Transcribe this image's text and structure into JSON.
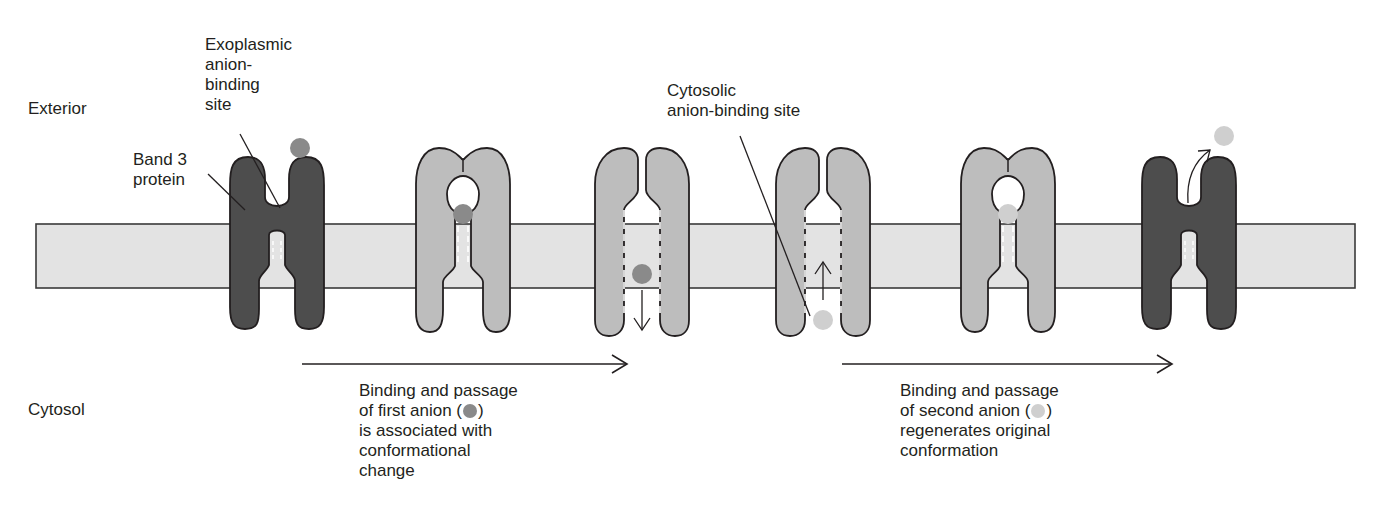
{
  "labels": {
    "exterior": "Exterior",
    "cytosol": "Cytosol",
    "band3": [
      "Band 3",
      "protein"
    ],
    "exoplasmic_site": [
      "Exoplasmic",
      "anion-",
      "binding",
      "site"
    ],
    "cytosolic_site": [
      "Cytosolic",
      "anion-binding site"
    ]
  },
  "captions": {
    "first": {
      "lines": [
        "Binding and passage",
        "of first anion (",
        "is associated with",
        "conformational",
        "change"
      ],
      "close": ")"
    },
    "second": {
      "lines": [
        "Binding and passage",
        "of second anion (",
        "regenerates original",
        "conformation"
      ],
      "close": ")"
    }
  },
  "colors": {
    "membrane_fill": "#e3e3e3",
    "membrane_stroke": "#3a3a3a",
    "protein_dark": "#4d4d4d",
    "protein_light": "#bdbdbd",
    "anion_first": "#8a8a8a",
    "anion_second": "#cfcfcf",
    "line": "#231f20"
  },
  "stages": [
    {
      "id": 1,
      "conformation": "outward-open",
      "shade": "dark",
      "anion": "first-outside"
    },
    {
      "id": 2,
      "conformation": "occluded-outward",
      "shade": "light",
      "anion": "first-bound"
    },
    {
      "id": 3,
      "conformation": "inward-open",
      "shade": "light",
      "anion": "first-released-down"
    },
    {
      "id": 4,
      "conformation": "inward-open",
      "shade": "light",
      "anion": "second-entering-up"
    },
    {
      "id": 5,
      "conformation": "occluded-outward",
      "shade": "light",
      "anion": "second-bound"
    },
    {
      "id": 6,
      "conformation": "outward-open",
      "shade": "dark",
      "anion": "second-released"
    }
  ]
}
